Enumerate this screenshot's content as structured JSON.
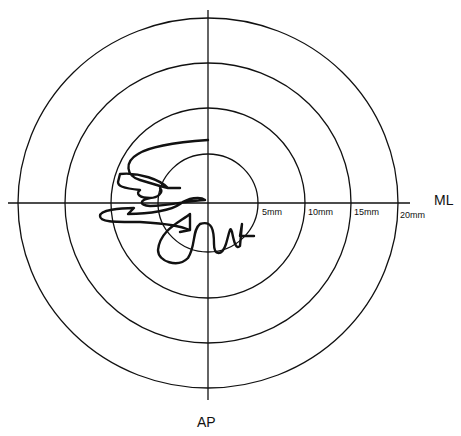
{
  "diagram": {
    "type": "stabilogram / center-of-pressure trace",
    "axes": {
      "horizontal": "ML",
      "vertical": "AP"
    },
    "rings": [
      {
        "label": "5mm",
        "radius_mm": 5
      },
      {
        "label": "10mm",
        "radius_mm": 10
      },
      {
        "label": "15mm",
        "radius_mm": 15
      },
      {
        "label": "20mm",
        "radius_mm": 20
      }
    ],
    "colors": {
      "line": "#111111",
      "background": "#ffffff"
    }
  }
}
